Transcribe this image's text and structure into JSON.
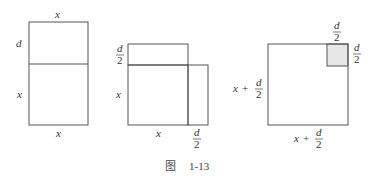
{
  "figure": {
    "caption_prefix": "图",
    "caption_number": "1-13",
    "panels": [
      {
        "id": "panel-1",
        "description": "rectangle split into d-by-x strip on top of x-by-x square",
        "labels": {
          "top": "x",
          "left_upper": "d",
          "left_lower": "x",
          "bottom": "x"
        }
      },
      {
        "id": "panel-2",
        "description": "d/2 strip on top and d/2 strip on right of x-by-x square",
        "labels": {
          "left_upper_num": "d",
          "left_upper_den": "2",
          "left_lower": "x",
          "bottom": "x",
          "bottom_right_num": "d",
          "bottom_right_den": "2"
        }
      },
      {
        "id": "panel-3",
        "description": "square of side x + d/2 with shaded d/2 corner square",
        "labels": {
          "top_num": "d",
          "top_den": "2",
          "right_num": "d",
          "right_den": "2",
          "left_x": "x",
          "left_plus": "+",
          "left_num": "d",
          "left_den": "2",
          "bottom_x": "x",
          "bottom_plus": "+",
          "bottom_num": "d",
          "bottom_den": "2"
        },
        "shade_color": "#e6e6e6"
      }
    ]
  }
}
